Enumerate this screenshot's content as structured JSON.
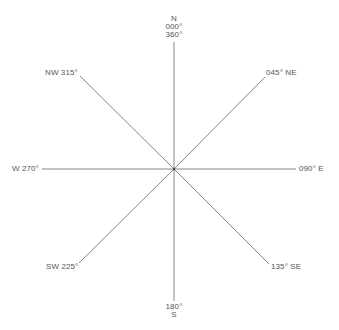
{
  "diagram": {
    "type": "compass-rose",
    "colors": {
      "line": "#888888",
      "text": "#555555",
      "background": "#ffffff"
    },
    "directions": {
      "n": {
        "letter": "N",
        "degree": "000°",
        "degree_alt": "360°"
      },
      "ne": {
        "label": "045° NE"
      },
      "e": {
        "label": "090° E"
      },
      "se": {
        "label": "135° SE"
      },
      "s": {
        "letter": "S",
        "degree": "180°"
      },
      "sw": {
        "label": "SW 225°"
      },
      "w": {
        "label": "W 270°"
      },
      "nw": {
        "label": "NW 315°"
      }
    }
  }
}
